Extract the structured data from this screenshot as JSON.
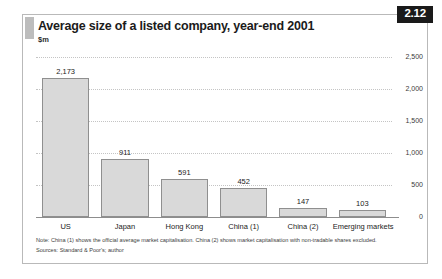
{
  "figure": {
    "number": "2.12",
    "title": "Average size of a listed company, year-end 2001",
    "subtitle": "$m"
  },
  "notes": {
    "note": "Note: China (1) shows the official average market capitalisation. China (2) shows market capitalisation with non-tradable shares excluded.",
    "sources": "Sources: Standard & Poor's; author"
  },
  "colors": {
    "bar_fill": "#d9d9d9",
    "bar_stroke": "#8f8f8f",
    "badge_bg": "#1a1a1a",
    "accent_bar": "#bdbdbd",
    "gridline": "#c4c4c4"
  },
  "chart_data": {
    "type": "bar",
    "title": "Average size of a listed company, year-end 2001",
    "subtitle": "$m",
    "xlabel": "",
    "ylabel": "$m",
    "ylim": [
      0,
      2500
    ],
    "yticks": [
      0,
      500,
      1000,
      1500,
      2000,
      2500
    ],
    "ytick_labels": [
      "0",
      "500",
      "1,000",
      "1,500",
      "2,000",
      "2,500"
    ],
    "grid": true,
    "axis_position": "right",
    "legend": null,
    "categories": [
      "US",
      "Japan",
      "Hong Kong",
      "China (1)",
      "China (2)",
      "Emerging markets"
    ],
    "values": [
      2173,
      911,
      591,
      452,
      147,
      103
    ],
    "value_labels": [
      "2,173",
      "911",
      "591",
      "452",
      "147",
      "103"
    ]
  }
}
